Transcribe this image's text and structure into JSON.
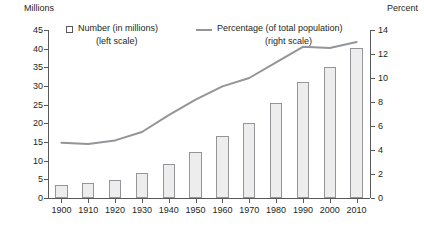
{
  "chart_data": {
    "type": "bar",
    "title": "",
    "xlabel": "",
    "ylabel": "Millions",
    "y2label": "Percent",
    "ylim": [
      0,
      45
    ],
    "y2lim": [
      0,
      14
    ],
    "grid": false,
    "legend_position": "top",
    "categories": [
      "1900",
      "1910",
      "1920",
      "1930",
      "1940",
      "1950",
      "1960",
      "1970",
      "1980",
      "1990",
      "2000",
      "2010"
    ],
    "series": [
      {
        "name": "Number (in millions)",
        "type": "bar",
        "axis": "left",
        "values": [
          3.4,
          4.0,
          4.9,
          6.6,
          9.0,
          12.3,
          16.7,
          20.1,
          25.5,
          31.2,
          35.2,
          40.3
        ]
      },
      {
        "name": "Percentage (of total population)",
        "type": "line",
        "axis": "right",
        "values": [
          4.6,
          4.5,
          4.8,
          5.5,
          6.9,
          8.2,
          9.3,
          10.0,
          11.3,
          12.6,
          12.5,
          13.0
        ]
      }
    ],
    "y_ticks": [
      0,
      5,
      10,
      15,
      20,
      25,
      30,
      35,
      40,
      45
    ],
    "y2_ticks": [
      0,
      2,
      4,
      6,
      8,
      10,
      12,
      14
    ],
    "colors": {
      "bar_fill": "#ededed",
      "bar_border": "#939598",
      "line": "#939598",
      "axis": "#58595b",
      "text": "#231f20"
    }
  },
  "axes": {
    "left_title": "Millions",
    "right_title": "Percent"
  },
  "legend": {
    "bar_label": "Number (in millions)",
    "bar_sublabel": "(left scale)",
    "line_label": "Percentage (of total population)",
    "line_sublabel": "(right scale)"
  }
}
